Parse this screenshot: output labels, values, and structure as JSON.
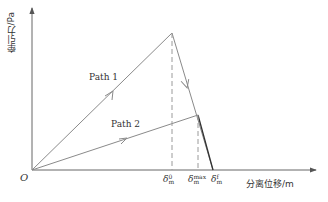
{
  "diagram": {
    "type": "bilinear traction-separation law",
    "y_axis_label": "牵引力/Pa",
    "x_axis_label": "分离位移/m",
    "origin_label": "O",
    "paths": [
      {
        "label": "Path 1",
        "description": "loading to peak, then softening to failure"
      },
      {
        "label": "Path 2",
        "description": "partial loading, unloading/softening"
      }
    ],
    "x_ticks": [
      {
        "symbol": "δ",
        "sub": "m",
        "sup": "0"
      },
      {
        "symbol": "δ",
        "sub": "m",
        "sup": "max"
      },
      {
        "symbol": "δ",
        "sub": "m",
        "sup": "f"
      }
    ],
    "colors": {
      "line": "#8a8a8a",
      "dark_line": "#333333",
      "dashed": "#9a9a9a",
      "axis": "#555555"
    }
  }
}
